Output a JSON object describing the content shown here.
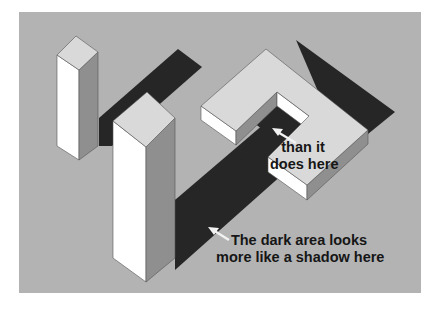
{
  "figure": {
    "colors": {
      "background": "#b3b3b3",
      "shadow": "#262626",
      "top_face": "#d9d9d9",
      "left_face": "#ffffff",
      "right_face": "#8f8f8f",
      "edge": "#555555",
      "arrow": "#f2f2f2",
      "page": "#ffffff"
    }
  },
  "annotations": {
    "upper": {
      "line1": "than it",
      "line2": "does here"
    },
    "lower": {
      "line1": "The dark area looks",
      "line2": "more like a shadow here"
    }
  }
}
